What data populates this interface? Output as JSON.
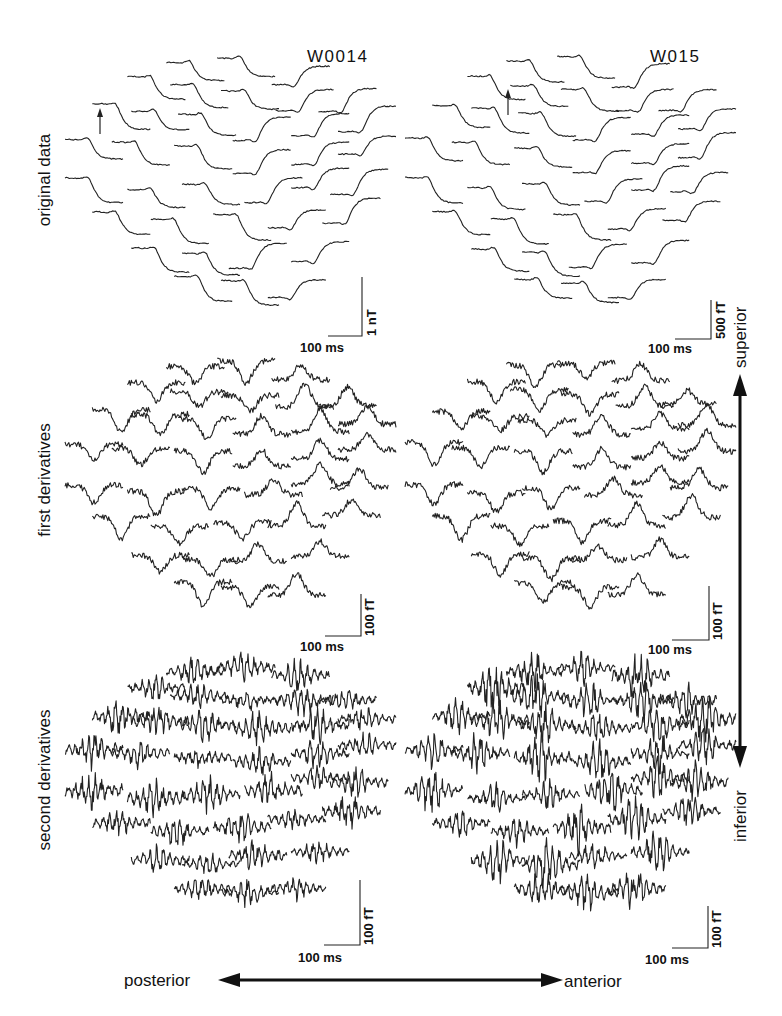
{
  "figure": {
    "columns": [
      {
        "id": "left",
        "subject": "W0014",
        "origin_x": 65
      },
      {
        "id": "right",
        "subject": "W015",
        "origin_x": 410
      }
    ],
    "rows": [
      {
        "id": "original",
        "label": "original data",
        "top": 40,
        "kind": "smooth",
        "scale": {
          "left": {
            "time": "100 ms",
            "amp": "1 nT"
          },
          "right": {
            "time": "100 ms",
            "amp": "500 fT"
          }
        }
      },
      {
        "id": "first",
        "label": "first derivatives",
        "top": 340,
        "kind": "first",
        "scale": {
          "left": {
            "time": "100 ms",
            "amp": "100 fT"
          },
          "right": {
            "time": "100 ms",
            "amp": "100 fT"
          }
        }
      },
      {
        "id": "second",
        "label": "second derivatives",
        "top": 640,
        "kind": "second",
        "scale": {
          "left": {
            "time": "100 ms",
            "amp": "100 fT"
          },
          "right": {
            "time": "100 ms",
            "amp": "100 fT"
          }
        }
      }
    ],
    "orientation": {
      "vertical": {
        "top_label": "superior",
        "bottom_label": "inferior"
      },
      "horizontal": {
        "left_label": "posterior",
        "right_label": "anterior"
      }
    },
    "marker": {
      "description": "arrow marking onset on reference channel",
      "icon": "up-arrow-icon"
    }
  }
}
